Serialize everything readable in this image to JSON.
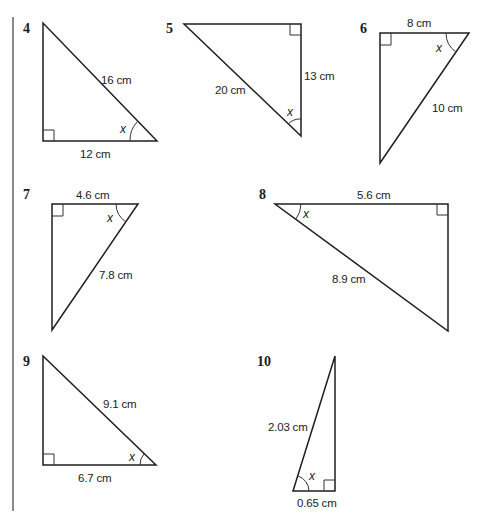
{
  "worksheet": {
    "problems": [
      {
        "number": "4",
        "hypotenuse": "16 cm",
        "adjacent": "12 cm",
        "angle_label": "x"
      },
      {
        "number": "5",
        "hypotenuse": "20 cm",
        "opposite_side": "13 cm",
        "angle_label": "x"
      },
      {
        "number": "6",
        "top_side": "8 cm",
        "hypotenuse": "10 cm",
        "angle_label": "x"
      },
      {
        "number": "7",
        "top_side": "4.6 cm",
        "hypotenuse": "7.8 cm",
        "angle_label": "x"
      },
      {
        "number": "8",
        "top_side": "5.6 cm",
        "hypotenuse": "8.9 cm",
        "angle_label": "x"
      },
      {
        "number": "9",
        "hypotenuse": "9.1 cm",
        "adjacent": "6.7 cm",
        "angle_label": "x"
      },
      {
        "number": "10",
        "hypotenuse": "2.03 cm",
        "adjacent": "0.65 cm",
        "angle_label": "x"
      }
    ]
  },
  "colors": {
    "line": "#1f1f1f",
    "margin_rule": "#8a8a8a",
    "background": "#ffffff"
  }
}
